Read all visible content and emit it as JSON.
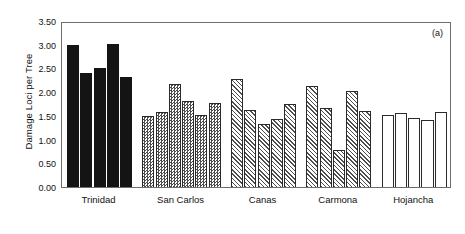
{
  "chart_data": {
    "type": "bar",
    "title": "",
    "panel_label": "(a)",
    "xlabel": "",
    "ylabel": "Damage Loci per Tree",
    "ylim": [
      0.0,
      3.5
    ],
    "ytick_labels": [
      "0.00",
      "0.50",
      "1.00",
      "1.50",
      "2.00",
      "2.50",
      "3.00",
      "3.50"
    ],
    "ytick_values": [
      0.0,
      0.5,
      1.0,
      1.5,
      2.0,
      2.5,
      3.0,
      3.5
    ],
    "grid": false,
    "legend": "none",
    "categories": [
      "Trinidad",
      "San Carlos",
      "Canas",
      "Carmona",
      "Hojancha"
    ],
    "groups": [
      {
        "name": "Trinidad",
        "fill": "solid",
        "values": [
          3.0,
          2.41,
          2.51,
          3.01,
          2.33
        ]
      },
      {
        "name": "San Carlos",
        "fill": "checker",
        "values": [
          1.49,
          1.58,
          2.18,
          1.81,
          1.52,
          1.77
        ]
      },
      {
        "name": "Canas",
        "fill": "hatch",
        "values": [
          2.28,
          1.63,
          1.32,
          1.44,
          1.76
        ]
      },
      {
        "name": "Carmona",
        "fill": "hatch",
        "values": [
          2.14,
          1.66,
          0.78,
          2.02,
          1.61
        ]
      },
      {
        "name": "Hojancha",
        "fill": "open",
        "values": [
          1.51,
          1.57,
          1.46,
          1.41,
          1.59
        ]
      }
    ]
  },
  "colors": {
    "solid_fill": "#141414",
    "pattern_stroke": "#4d4d4d",
    "bar_outline": "#2a2a2a",
    "axis": "#6e6e6e",
    "text": "#111111",
    "background": "#ffffff"
  }
}
